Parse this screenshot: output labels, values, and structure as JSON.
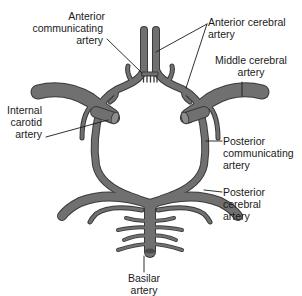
{
  "diagram": {
    "colors": {
      "vessel_fill": "#6e6e6e",
      "vessel_outline": "#3a3a3a",
      "vessel_highlight": "#8a8a8a",
      "leader_line": "#1a1a1a",
      "text": "#1a1a1a",
      "background": "#ffffff"
    },
    "labels": {
      "anterior_communicating": {
        "line1": "Anterior",
        "line2": "communicating",
        "line3": "artery"
      },
      "anterior_cerebral": {
        "line1": "Anterior cerebral",
        "line2": "artery"
      },
      "middle_cerebral": {
        "line1": "Middle cerebral",
        "line2": "artery"
      },
      "internal_carotid": {
        "line1": "Internal",
        "line2": "carotid",
        "line3": "artery"
      },
      "posterior_communicating": {
        "line1": "Posterior",
        "line2": "communicating",
        "line3": "artery"
      },
      "posterior_cerebral": {
        "line1": "Posterior",
        "line2": "cerebral",
        "line3": "artery"
      },
      "basilar": {
        "line1": "Basilar",
        "line2": "artery"
      }
    }
  }
}
